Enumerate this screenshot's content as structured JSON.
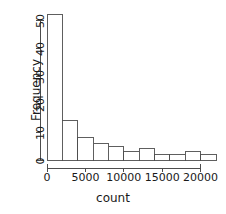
{
  "chart_data": {
    "type": "bar",
    "title": "",
    "xlabel": "count",
    "ylabel": "Frequency",
    "bin_width": 2000,
    "bin_edges": [
      0,
      2000,
      4000,
      6000,
      8000,
      10000,
      12000,
      14000,
      16000,
      18000,
      20000,
      22000
    ],
    "categories": [
      "0-2000",
      "2000-4000",
      "4000-6000",
      "6000-8000",
      "8000-10000",
      "10000-12000",
      "12000-14000",
      "14000-16000",
      "16000-18000",
      "18000-20000",
      "20000-22000"
    ],
    "values": [
      52,
      14,
      8,
      6,
      5,
      3,
      4,
      2,
      2,
      3,
      2
    ],
    "xlim": [
      0,
      22000
    ],
    "ylim": [
      0,
      52
    ],
    "xticks": [
      0,
      5000,
      10000,
      15000,
      20000
    ],
    "xtick_labels": [
      "0",
      "5000",
      "10000",
      "15000",
      "20000"
    ],
    "yticks": [
      0,
      10,
      20,
      30,
      40,
      50
    ],
    "ytick_labels": [
      "0",
      "10",
      "20",
      "30",
      "40",
      "50"
    ],
    "grid": false,
    "legend": false,
    "bar_fill_color": "#ffffff",
    "bar_stroke_color": "#4d4d4d",
    "axis_color": "#4d4d4d",
    "text_color": "#1a1a1a"
  }
}
